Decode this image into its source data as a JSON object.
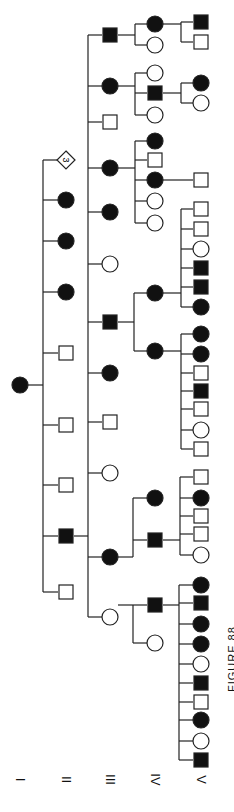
{
  "figure": {
    "label": "FIGURE 88",
    "type": "pedigree",
    "orientation": "rotated-90",
    "colors": {
      "affected": "#111111",
      "unaffected": "#ffffff",
      "line": "#222222"
    }
  },
  "generations": [
    {
      "label": "I",
      "x": 20
    },
    {
      "label": "II",
      "x": 66
    },
    {
      "label": "III",
      "x": 110
    },
    {
      "label": "IV",
      "x": 155
    },
    {
      "label": "V",
      "x": 201
    }
  ],
  "individuals": [
    {
      "id": "I-1",
      "gen": 0,
      "y": 385,
      "sex": "F",
      "affected": true
    },
    {
      "id": "II-1",
      "gen": 1,
      "y": 160,
      "sex": "U",
      "affected": false,
      "count": "3"
    },
    {
      "id": "II-2",
      "gen": 1,
      "y": 200,
      "sex": "F",
      "affected": true
    },
    {
      "id": "II-3",
      "gen": 1,
      "y": 241,
      "sex": "F",
      "affected": true
    },
    {
      "id": "II-4",
      "gen": 1,
      "y": 292,
      "sex": "F",
      "affected": true
    },
    {
      "id": "II-5",
      "gen": 1,
      "y": 353,
      "sex": "M",
      "affected": false
    },
    {
      "id": "II-6",
      "gen": 1,
      "y": 425,
      "sex": "M",
      "affected": false
    },
    {
      "id": "II-7",
      "gen": 1,
      "y": 485,
      "sex": "M",
      "affected": false
    },
    {
      "id": "II-8",
      "gen": 1,
      "y": 536,
      "sex": "M",
      "affected": true
    },
    {
      "id": "II-9",
      "gen": 1,
      "y": 592,
      "sex": "M",
      "affected": false
    },
    {
      "id": "III-1",
      "gen": 2,
      "y": 35,
      "sex": "M",
      "affected": true
    },
    {
      "id": "III-2",
      "gen": 2,
      "y": 86,
      "sex": "F",
      "affected": true
    },
    {
      "id": "III-3",
      "gen": 2,
      "y": 122,
      "sex": "M",
      "affected": false
    },
    {
      "id": "III-4",
      "gen": 2,
      "y": 168,
      "sex": "F",
      "affected": true
    },
    {
      "id": "III-5",
      "gen": 2,
      "y": 212,
      "sex": "F",
      "affected": true
    },
    {
      "id": "III-6",
      "gen": 2,
      "y": 264,
      "sex": "F",
      "affected": false
    },
    {
      "id": "III-7",
      "gen": 2,
      "y": 322,
      "sex": "M",
      "affected": true
    },
    {
      "id": "III-8",
      "gen": 2,
      "y": 373,
      "sex": "F",
      "affected": true
    },
    {
      "id": "III-9",
      "gen": 2,
      "y": 422,
      "sex": "M",
      "affected": false
    },
    {
      "id": "III-10",
      "gen": 2,
      "y": 473,
      "sex": "F",
      "affected": false
    },
    {
      "id": "III-11",
      "gen": 2,
      "y": 557,
      "sex": "F",
      "affected": true
    },
    {
      "id": "III-12",
      "gen": 2,
      "y": 617,
      "sex": "F",
      "affected": false
    },
    {
      "id": "IV-1",
      "gen": 3,
      "y": 24,
      "sex": "F",
      "affected": true
    },
    {
      "id": "IV-2",
      "gen": 3,
      "y": 45,
      "sex": "F",
      "affected": false
    },
    {
      "id": "IV-3",
      "gen": 3,
      "y": 73,
      "sex": "F",
      "affected": false
    },
    {
      "id": "IV-4",
      "gen": 3,
      "y": 93,
      "sex": "M",
      "affected": true
    },
    {
      "id": "IV-5",
      "gen": 3,
      "y": 115,
      "sex": "F",
      "affected": false
    },
    {
      "id": "IV-6",
      "gen": 3,
      "y": 141,
      "sex": "F",
      "affected": true
    },
    {
      "id": "IV-7",
      "gen": 3,
      "y": 160,
      "sex": "M",
      "affected": false
    },
    {
      "id": "IV-8",
      "gen": 3,
      "y": 180,
      "sex": "F",
      "affected": true
    },
    {
      "id": "IV-9",
      "gen": 3,
      "y": 201,
      "sex": "F",
      "affected": false
    },
    {
      "id": "IV-10",
      "gen": 3,
      "y": 223,
      "sex": "F",
      "affected": false
    },
    {
      "id": "IV-11",
      "gen": 3,
      "y": 293,
      "sex": "F",
      "affected": true
    },
    {
      "id": "IV-12",
      "gen": 3,
      "y": 351,
      "sex": "F",
      "affected": true
    },
    {
      "id": "IV-13",
      "gen": 3,
      "y": 498,
      "sex": "F",
      "affected": true
    },
    {
      "id": "IV-14",
      "gen": 3,
      "y": 540,
      "sex": "M",
      "affected": true
    },
    {
      "id": "IV-15",
      "gen": 3,
      "y": 605,
      "sex": "M",
      "affected": true
    },
    {
      "id": "IV-16",
      "gen": 3,
      "y": 643,
      "sex": "F",
      "affected": false
    },
    {
      "id": "V-1",
      "gen": 4,
      "y": 22,
      "sex": "M",
      "affected": true
    },
    {
      "id": "V-2",
      "gen": 4,
      "y": 42,
      "sex": "M",
      "affected": false
    },
    {
      "id": "V-3",
      "gen": 4,
      "y": 83,
      "sex": "F",
      "affected": true
    },
    {
      "id": "V-4",
      "gen": 4,
      "y": 103,
      "sex": "F",
      "affected": false
    },
    {
      "id": "V-5",
      "gen": 4,
      "y": 180,
      "sex": "M",
      "affected": false
    },
    {
      "id": "V-6",
      "gen": 4,
      "y": 209,
      "sex": "M",
      "affected": false
    },
    {
      "id": "V-7",
      "gen": 4,
      "y": 229,
      "sex": "M",
      "affected": false
    },
    {
      "id": "V-8",
      "gen": 4,
      "y": 249,
      "sex": "F",
      "affected": false
    },
    {
      "id": "V-9",
      "gen": 4,
      "y": 268,
      "sex": "M",
      "affected": true
    },
    {
      "id": "V-10",
      "gen": 4,
      "y": 287,
      "sex": "M",
      "affected": true
    },
    {
      "id": "V-11",
      "gen": 4,
      "y": 307,
      "sex": "F",
      "affected": true
    },
    {
      "id": "V-12",
      "gen": 4,
      "y": 334,
      "sex": "F",
      "affected": true
    },
    {
      "id": "V-13",
      "gen": 4,
      "y": 354,
      "sex": "F",
      "affected": true
    },
    {
      "id": "V-14",
      "gen": 4,
      "y": 373,
      "sex": "M",
      "affected": false
    },
    {
      "id": "V-15",
      "gen": 4,
      "y": 391,
      "sex": "M",
      "affected": true
    },
    {
      "id": "V-16",
      "gen": 4,
      "y": 409,
      "sex": "M",
      "affected": false
    },
    {
      "id": "V-17",
      "gen": 4,
      "y": 430,
      "sex": "F",
      "affected": false
    },
    {
      "id": "V-18",
      "gen": 4,
      "y": 449,
      "sex": "M",
      "affected": false
    },
    {
      "id": "V-19",
      "gen": 4,
      "y": 477,
      "sex": "M",
      "affected": false
    },
    {
      "id": "V-20",
      "gen": 4,
      "y": 498,
      "sex": "F",
      "affected": true
    },
    {
      "id": "V-21",
      "gen": 4,
      "y": 516,
      "sex": "M",
      "affected": false
    },
    {
      "id": "V-22",
      "gen": 4,
      "y": 534,
      "sex": "M",
      "affected": false
    },
    {
      "id": "V-23",
      "gen": 4,
      "y": 555,
      "sex": "F",
      "affected": false
    },
    {
      "id": "V-24",
      "gen": 4,
      "y": 585,
      "sex": "F",
      "affected": true
    },
    {
      "id": "V-25",
      "gen": 4,
      "y": 603,
      "sex": "M",
      "affected": true
    },
    {
      "id": "V-26",
      "gen": 4,
      "y": 624,
      "sex": "F",
      "affected": true
    },
    {
      "id": "V-27",
      "gen": 4,
      "y": 644,
      "sex": "F",
      "affected": true
    },
    {
      "id": "V-28",
      "gen": 4,
      "y": 664,
      "sex": "F",
      "affected": false
    },
    {
      "id": "V-29",
      "gen": 4,
      "y": 683,
      "sex": "M",
      "affected": true
    },
    {
      "id": "V-30",
      "gen": 4,
      "y": 702,
      "sex": "M",
      "affected": false
    },
    {
      "id": "V-31",
      "gen": 4,
      "y": 720,
      "sex": "F",
      "affected": true
    },
    {
      "id": "V-32",
      "gen": 4,
      "y": 741,
      "sex": "F",
      "affected": false
    },
    {
      "id": "V-33",
      "gen": 4,
      "y": 760,
      "sex": "M",
      "affected": true
    }
  ],
  "sibships": [
    {
      "parentGen": 0,
      "parentY": 385,
      "childGen": 1,
      "lineX": 43,
      "children": [
        "II-1",
        "II-2",
        "II-3",
        "II-4",
        "II-5",
        "II-6",
        "II-7",
        "II-8",
        "II-9"
      ]
    },
    {
      "parentGen": 1,
      "parentY": 536,
      "childGen": 2,
      "lineX": 88,
      "children": [
        "III-1",
        "III-2",
        "III-3",
        "III-4",
        "III-5",
        "III-6",
        "III-7",
        "III-8",
        "III-9",
        "III-10",
        "III-11",
        "III-12"
      ]
    },
    {
      "parentGen": 2,
      "parentY": 35,
      "childGen": 3,
      "lineX": 135,
      "children": [
        "IV-1",
        "IV-2"
      ]
    },
    {
      "parentGen": 2,
      "parentY": 86,
      "childGen": 3,
      "lineX": 135,
      "children": [
        "IV-3",
        "IV-4",
        "IV-5"
      ]
    },
    {
      "parentGen": 2,
      "parentY": 168,
      "childGen": 3,
      "lineX": 135,
      "children": [
        "IV-6",
        "IV-7",
        "IV-8",
        "IV-9",
        "IV-10"
      ]
    },
    {
      "parentGen": 2,
      "parentY": 322,
      "childGen": 3,
      "lineX": 134,
      "children": [
        "IV-11",
        "IV-12"
      ]
    },
    {
      "parentGen": 2,
      "parentY": 557,
      "childGen": 3,
      "lineX": 133,
      "children": [
        "IV-13",
        "IV-14"
      ]
    },
    {
      "parentGen": 2,
      "parentY": 617,
      "childGen": 3,
      "lineX": 133,
      "children": [
        "IV-15",
        "IV-16"
      ],
      "attachY": 605
    },
    {
      "parentGen": 3,
      "parentY": 24,
      "childGen": 4,
      "lineX": 181,
      "children": [
        "V-1",
        "V-2"
      ]
    },
    {
      "parentGen": 3,
      "parentY": 93,
      "childGen": 4,
      "lineX": 181,
      "children": [
        "V-3",
        "V-4"
      ]
    },
    {
      "parentGen": 3,
      "parentY": 180,
      "childGen": 4,
      "lineX": null,
      "children": [
        "V-5"
      ]
    },
    {
      "parentGen": 3,
      "parentY": 293,
      "childGen": 4,
      "lineX": 181,
      "children": [
        "V-6",
        "V-7",
        "V-8",
        "V-9",
        "V-10",
        "V-11"
      ]
    },
    {
      "parentGen": 3,
      "parentY": 351,
      "childGen": 4,
      "lineX": 181,
      "children": [
        "V-12",
        "V-13",
        "V-14",
        "V-15",
        "V-16",
        "V-17",
        "V-18"
      ]
    },
    {
      "parentGen": 3,
      "parentY": 540,
      "childGen": 4,
      "lineX": 180,
      "children": [
        "V-19",
        "V-20",
        "V-21",
        "V-22",
        "V-23"
      ]
    },
    {
      "parentGen": 3,
      "parentY": 605,
      "childGen": 4,
      "lineX": 179,
      "children": [
        "V-24",
        "V-25",
        "V-26",
        "V-27",
        "V-28",
        "V-29",
        "V-30",
        "V-31",
        "V-32",
        "V-33"
      ]
    }
  ]
}
